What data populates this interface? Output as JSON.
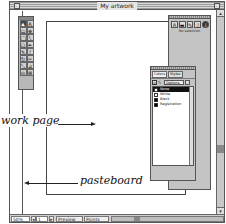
{
  "window": {
    "title": "My artwork"
  },
  "toolbox": {
    "tools": [
      {
        "name": "pointer-tool",
        "glyph": "▲",
        "active": true
      },
      {
        "name": "text-tool",
        "glyph": "A"
      },
      {
        "name": "rectangle-tool",
        "glyph": "▭"
      },
      {
        "name": "zoom-tool",
        "glyph": "⊕"
      },
      {
        "name": "ellipse-tool",
        "glyph": "◯"
      },
      {
        "name": "line-tool",
        "glyph": "╲"
      },
      {
        "name": "polygon-tool",
        "glyph": "⬠"
      },
      {
        "name": "pen-tool",
        "glyph": "✒"
      },
      {
        "name": "freehand-tool",
        "glyph": "✎"
      },
      {
        "name": "bezigon-tool",
        "glyph": "ℐ"
      },
      {
        "name": "rotate-tool",
        "glyph": "↻"
      },
      {
        "name": "knife-tool",
        "glyph": "✂"
      },
      {
        "name": "scale-tool",
        "glyph": "⤡"
      },
      {
        "name": "skew-tool",
        "glyph": "⊿"
      },
      {
        "name": "trace-tool",
        "glyph": "◎"
      },
      {
        "name": "hand-tool",
        "glyph": "⊞"
      }
    ]
  },
  "inspector": {
    "icons": [
      {
        "name": "object-inspector-icon",
        "glyph": "A"
      },
      {
        "name": "fill-inspector-icon",
        "glyph": "▬"
      },
      {
        "name": "stroke-inspector-icon",
        "glyph": "✎"
      },
      {
        "name": "document-inspector-icon",
        "glyph": "▯"
      },
      {
        "name": "info-inspector-icon",
        "glyph": "i"
      }
    ],
    "status": "No selection"
  },
  "color_list": {
    "tabs": [
      {
        "label": "Colors",
        "active": true
      },
      {
        "label": "Styles"
      }
    ],
    "options_label": "Options ▾",
    "rows": [
      {
        "label": "None",
        "color": "#ffffff",
        "selected": true
      },
      {
        "label": "White",
        "color": "#ffffff"
      },
      {
        "label": "Black",
        "color": "#000000"
      },
      {
        "label": "Registration",
        "color": "#000000"
      }
    ]
  },
  "statusbar": {
    "zoom": "50%",
    "prev": "◂",
    "page": "1",
    "next": "▸",
    "mode": "Preview",
    "units": "Points"
  },
  "annotations": {
    "work_page": "work page",
    "pasteboard": "pasteboard"
  },
  "scroll": {
    "up": "▴",
    "down": "▾"
  }
}
